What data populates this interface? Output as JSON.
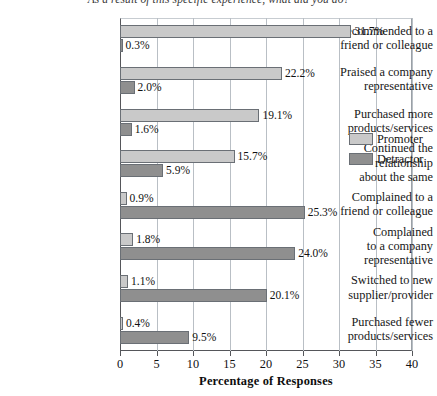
{
  "chart_data": {
    "type": "bar",
    "orientation": "horizontal",
    "title": "As a result of this specific experience, what did you do?",
    "xlabel": "Percentage of Responses",
    "ylabel": "",
    "xlim": [
      0,
      40
    ],
    "xticks": [
      "0",
      "5",
      "10",
      "15",
      "20",
      "25",
      "30",
      "35",
      "40"
    ],
    "grid": true,
    "legend_position": "right",
    "categories": [
      "Recommended to a\nfriend or colleague",
      "Praised a company\nrepresentative",
      "Purchased more\nproducts/services",
      "Continued the\nrelationship\nabout the same",
      "Complained to a\nfriend or colleague",
      "Complained\nto a company\nrepresentative",
      "Switched to new\nsupplier/provider",
      "Purchased fewer\nproducts/services"
    ],
    "series": [
      {
        "name": "Promoter",
        "color": "#c9c9c9",
        "values": [
          31.7,
          22.2,
          19.1,
          15.7,
          0.9,
          1.8,
          1.1,
          0.4
        ],
        "labels": [
          "31.7%",
          "22.2%",
          "19.1%",
          "15.7%",
          "0.9%",
          "1.8%",
          "1.1%",
          "0.4%"
        ]
      },
      {
        "name": "Detractor",
        "color": "#8f8f8f",
        "values": [
          0.3,
          2.0,
          1.6,
          5.9,
          25.3,
          24.0,
          20.1,
          9.5
        ],
        "labels": [
          "0.3%",
          "2.0%",
          "1.6%",
          "5.9%",
          "25.3%",
          "24.0%",
          "20.1%",
          "9.5%"
        ]
      }
    ]
  },
  "legend": {
    "items": [
      {
        "label": "Promoter",
        "swatch": "promoter"
      },
      {
        "label": "Detractor",
        "swatch": "detractor"
      }
    ]
  }
}
